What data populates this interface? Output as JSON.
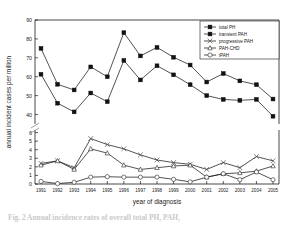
{
  "figure": {
    "xlabel": "year of diagnosis",
    "ylabel": "annual incident cases per million",
    "caption_fragment": "Fig. 2   Annual incidence rates of overall total PH, PAH,"
  },
  "chart_data": {
    "type": "line",
    "title": "",
    "xlabel": "year of diagnosis",
    "ylabel": "annual incident cases per million",
    "grid": false,
    "legend_position": "top-right",
    "axis_break": true,
    "upper_ylim": [
      35,
      90
    ],
    "upper_yticks": [
      40,
      50,
      60,
      70,
      80,
      90
    ],
    "lower_ylim": [
      0,
      6
    ],
    "lower_yticks": [
      0,
      1,
      2,
      3,
      4,
      5,
      6
    ],
    "x": [
      1991,
      1992,
      1993,
      1994,
      1995,
      1996,
      1997,
      1998,
      1999,
      2000,
      2001,
      2002,
      2003,
      2004,
      2005
    ],
    "categories": [
      "1991",
      "1992",
      "1993",
      "1994",
      "1995",
      "1996",
      "1997",
      "1998",
      "1999",
      "2000",
      "2001",
      "2002",
      "2003",
      "2004",
      "2005"
    ],
    "series": [
      {
        "name": "total PH",
        "marker": "filled-square",
        "axis": "upper",
        "values": [
          75.0,
          56.0,
          53.0,
          65.2,
          60.0,
          83.3,
          71.0,
          75.5,
          70.3,
          66.2,
          57.2,
          61.7,
          57.8,
          55.8,
          48.2
        ]
      },
      {
        "name": "transient PAH",
        "marker": "filled-square",
        "axis": "upper",
        "values": [
          61.3,
          46.0,
          41.4,
          51.4,
          46.8,
          68.6,
          58.3,
          65.8,
          61.0,
          55.8,
          50.0,
          48.0,
          47.5,
          48.0,
          39.1
        ]
      },
      {
        "name": "progressive PAH",
        "marker": "cross",
        "axis": "lower",
        "values": [
          2.4,
          2.7,
          1.9,
          5.3,
          4.6,
          4.1,
          3.4,
          2.8,
          2.5,
          2.3,
          1.7,
          2.5,
          1.9,
          3.2,
          2.7
        ]
      },
      {
        "name": "PAH-CHD",
        "marker": "open-triangle",
        "axis": "lower",
        "values": [
          2.2,
          2.7,
          1.7,
          4.1,
          3.6,
          2.2,
          1.7,
          1.9,
          2.1,
          2.2,
          0.8,
          1.2,
          1.3,
          1.5,
          2.1
        ]
      },
      {
        "name": "iPAH",
        "marker": "open-circle",
        "axis": "lower",
        "values": [
          0.3,
          0.05,
          0.2,
          0.8,
          0.85,
          0.8,
          0.8,
          0.8,
          0.55,
          0.25,
          0.8,
          1.2,
          0.5,
          1.4,
          0.5
        ]
      }
    ]
  }
}
